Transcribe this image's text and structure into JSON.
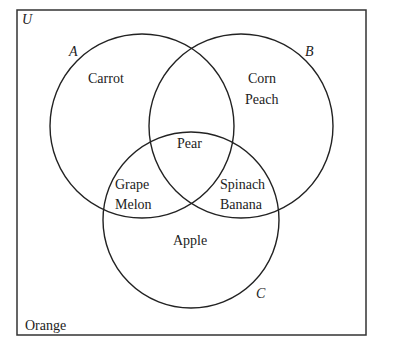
{
  "diagram": {
    "type": "venn",
    "universe": {
      "label": "U",
      "outside_elements": [
        "Orange"
      ]
    },
    "sets": [
      {
        "name": "A",
        "label": "A"
      },
      {
        "name": "B",
        "label": "B"
      },
      {
        "name": "C",
        "label": "C"
      }
    ],
    "regions": {
      "A_only": [
        "Carrot"
      ],
      "B_only": [
        "Corn",
        "Peach"
      ],
      "A_and_B_and_C": [
        "Pear"
      ],
      "A_and_C_only": [
        "Grape",
        "Melon"
      ],
      "B_and_C_only": [
        "Spinach",
        "Banana"
      ],
      "C_only": [
        "Apple"
      ],
      "none": [
        "Orange"
      ]
    },
    "colors": {
      "stroke": "#222222",
      "background": "#ffffff"
    }
  }
}
